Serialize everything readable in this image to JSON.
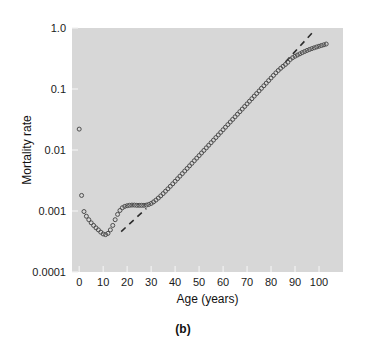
{
  "figure": {
    "caption": "(b)",
    "background_color": "#ffffff",
    "plot_background_color": "#d7d7d7"
  },
  "chart_data": {
    "type": "scatter",
    "title": "",
    "subtitle": "",
    "xlabel": "Age (years)",
    "ylabel": "Mortality rate",
    "yscale": "log",
    "xscale": "linear",
    "xlim": [
      -3,
      110
    ],
    "ylim": [
      0.0001,
      1.0
    ],
    "grid": false,
    "legend": null,
    "marker_style": "open-circle",
    "marker_color": "#4d4d4d",
    "xticks": [
      0,
      10,
      20,
      30,
      40,
      50,
      60,
      70,
      80,
      90,
      100
    ],
    "xtick_labels": [
      "0",
      "10",
      "20",
      "30",
      "40",
      "50",
      "60",
      "70",
      "80",
      "90",
      "100"
    ],
    "yticks": [
      0.0001,
      0.001,
      0.01,
      0.1,
      1.0
    ],
    "ytick_labels": [
      "0.0001",
      "0.001",
      "0.01",
      "0.1",
      "1.0"
    ],
    "series": [
      {
        "name": "Mortality rate by age",
        "x": [
          0,
          1,
          2,
          3,
          4,
          5,
          6,
          7,
          8,
          9,
          10,
          11,
          12,
          13,
          14,
          15,
          16,
          17,
          18,
          19,
          20,
          21,
          22,
          23,
          24,
          25,
          26,
          27,
          28,
          29,
          30,
          31,
          32,
          33,
          34,
          35,
          36,
          37,
          38,
          39,
          40,
          41,
          42,
          43,
          44,
          45,
          46,
          47,
          48,
          49,
          50,
          51,
          52,
          53,
          54,
          55,
          56,
          57,
          58,
          59,
          60,
          61,
          62,
          63,
          64,
          65,
          66,
          67,
          68,
          69,
          70,
          71,
          72,
          73,
          74,
          75,
          76,
          77,
          78,
          79,
          80,
          81,
          82,
          83,
          84,
          85,
          86,
          87,
          88,
          89,
          90,
          91,
          92,
          93,
          94,
          95,
          96,
          97,
          98,
          99,
          100,
          101,
          102,
          103
        ],
        "y": [
          0.022,
          0.0018,
          0.00098,
          0.00082,
          0.00072,
          0.00064,
          0.00058,
          0.00053,
          0.00049,
          0.00045,
          0.00042,
          0.00041,
          0.00043,
          0.00049,
          0.00058,
          0.00072,
          0.00088,
          0.00102,
          0.00113,
          0.00119,
          0.00122,
          0.00124,
          0.00125,
          0.00125,
          0.00124,
          0.00124,
          0.00124,
          0.00124,
          0.00125,
          0.00128,
          0.00133,
          0.00141,
          0.00151,
          0.00163,
          0.00177,
          0.00193,
          0.00211,
          0.00231,
          0.00254,
          0.00279,
          0.00307,
          0.00338,
          0.00372,
          0.0041,
          0.00452,
          0.00498,
          0.00549,
          0.00605,
          0.00667,
          0.00735,
          0.0081,
          0.00893,
          0.00984,
          0.01085,
          0.01196,
          0.01318,
          0.01453,
          0.01602,
          0.01766,
          0.01947,
          0.02147,
          0.02367,
          0.0261,
          0.02878,
          0.03173,
          0.03499,
          0.03858,
          0.04255,
          0.04692,
          0.05174,
          0.05706,
          0.06292,
          0.06938,
          0.0765,
          0.08435,
          0.093,
          0.10253,
          0.11305,
          0.12464,
          0.13742,
          0.15151,
          0.16701,
          0.18375,
          0.20105,
          0.21837,
          0.2355,
          0.25307,
          0.2742,
          0.3046,
          0.3268,
          0.3442,
          0.3606,
          0.3772,
          0.3948,
          0.4118,
          0.4286,
          0.4442,
          0.4596,
          0.4742,
          0.4884,
          0.5025,
          0.5165,
          0.5302,
          0.5461
        ]
      }
    ],
    "annotations": [
      {
        "name": "gompertz-reference-line-lower",
        "style": "dashed",
        "description": "Dashed Gompertz reference line through young-adult ages",
        "x_start": 17.5,
        "y_start": 0.00046,
        "x_end": 28.0,
        "y_end": 0.0011
      },
      {
        "name": "gompertz-reference-line-upper",
        "style": "dashed",
        "description": "Dashed Gompertz extrapolation above the oldest ages",
        "x_start": 86.0,
        "y_start": 0.277,
        "x_end": 97.5,
        "y_end": 0.86
      }
    ]
  }
}
